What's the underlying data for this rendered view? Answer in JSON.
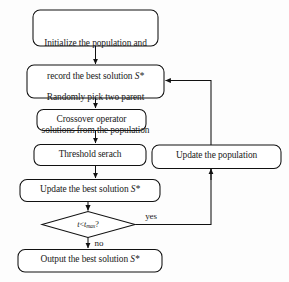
{
  "diagram": {
    "type": "flowchart",
    "stroke_color": "#111111",
    "fill_color": "#ffffff",
    "background_color": "#fdfdfd",
    "nodes": [
      {
        "id": "init",
        "shape": "rounded-rectangle",
        "line1": "Initialize the population and",
        "line2a": "record the best solution ",
        "line2b": "S*"
      },
      {
        "id": "pick-parents",
        "shape": "rounded-rectangle",
        "line1": "Randomly pick two parent",
        "line2": "solutions from the population"
      },
      {
        "id": "crossover",
        "shape": "rounded-rectangle",
        "label": "Crossover operator"
      },
      {
        "id": "threshold-search",
        "shape": "rounded-rectangle",
        "label": "Threshold serach"
      },
      {
        "id": "update-population",
        "shape": "rounded-rectangle",
        "label": "Update the population"
      },
      {
        "id": "update-best",
        "shape": "rounded-rectangle",
        "line_a": "Update the best solution ",
        "line_b": "S*"
      },
      {
        "id": "output-best",
        "shape": "rounded-rectangle",
        "line_a": "Output the best solution ",
        "line_b": "S*"
      }
    ],
    "decision": {
      "id": "stop-condition",
      "shape": "diamond",
      "var": "t",
      "operator": "<",
      "limit_base": "t",
      "limit_sub": "max",
      "question_mark": "?"
    },
    "edge_labels": {
      "yes": "yes",
      "no": "no"
    }
  }
}
